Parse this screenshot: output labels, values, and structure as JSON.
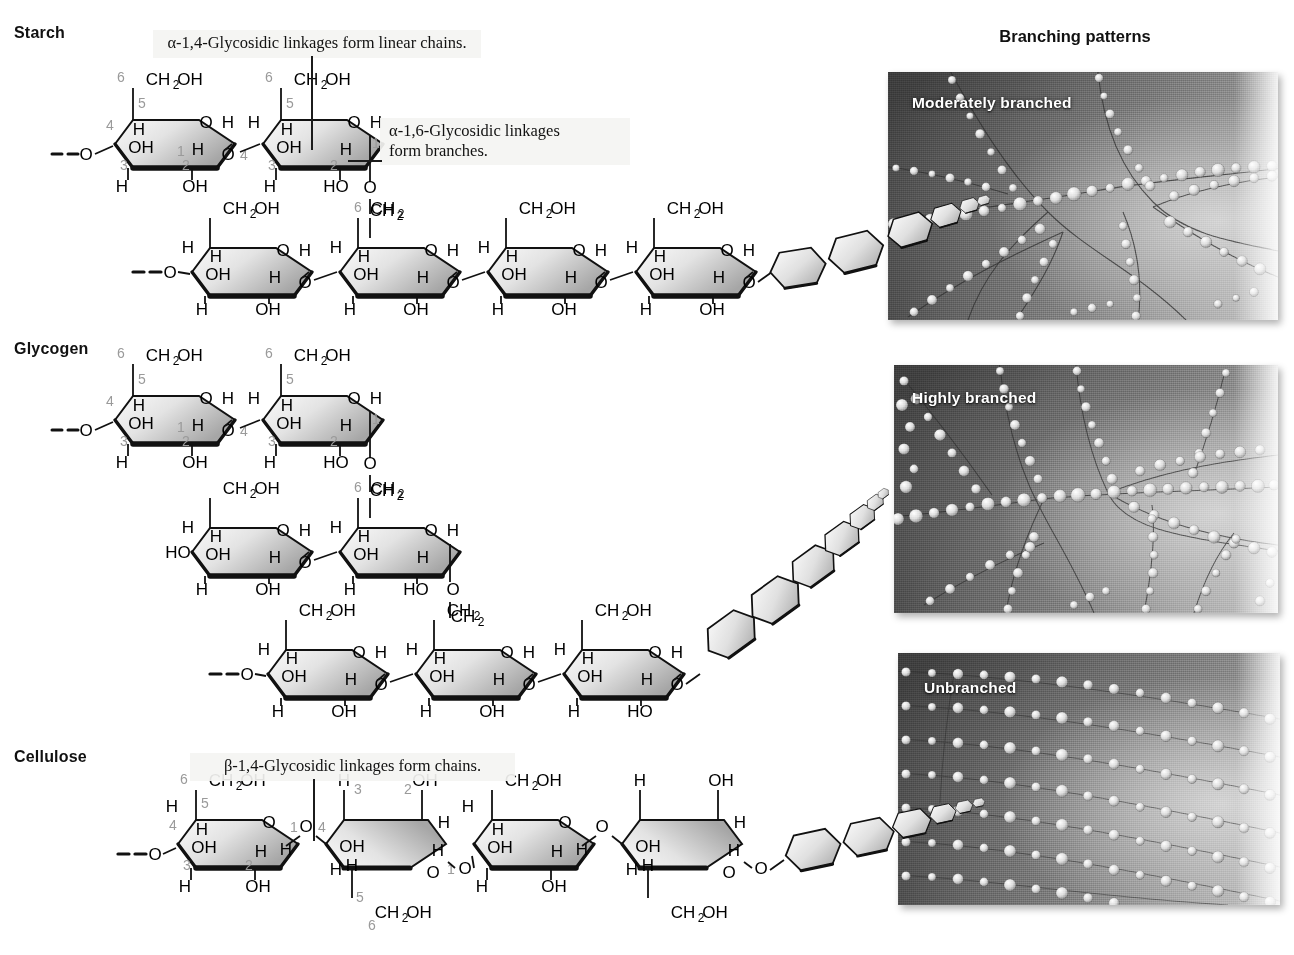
{
  "figure": {
    "type": "polysaccharide-structure-diagram",
    "right_column_header": "Branching patterns"
  },
  "sections": [
    {
      "id": "starch",
      "title": "Starch",
      "callouts": [
        {
          "id": "alpha14",
          "text": "α-1,4-Glycosidic linkages form linear chains."
        },
        {
          "id": "alpha16",
          "line1": "α-1,6-Glycosidic linkages",
          "line2": "form branches."
        }
      ],
      "micrograph": {
        "label": "Moderately branched",
        "pattern": "moderately-branched"
      },
      "ring_numbers": [
        "1",
        "2",
        "3",
        "4",
        "5",
        "6"
      ],
      "groups": [
        "CH₂OH",
        "OH",
        "HO",
        "H",
        "O",
        "CH₂"
      ]
    },
    {
      "id": "glycogen",
      "title": "Glycogen",
      "callouts": [],
      "micrograph": {
        "label": "Highly branched",
        "pattern": "highly-branched"
      },
      "ring_numbers": [
        "1",
        "2",
        "3",
        "4",
        "5",
        "6"
      ],
      "groups": [
        "CH₂OH",
        "OH",
        "HO",
        "H",
        "O",
        "CH₂"
      ]
    },
    {
      "id": "cellulose",
      "title": "Cellulose",
      "callouts": [
        {
          "id": "beta14",
          "text": "β-1,4-Glycosidic linkages form chains."
        }
      ],
      "micrograph": {
        "label": "Unbranched",
        "pattern": "unbranched"
      },
      "ring_numbers": [
        "1",
        "2",
        "3",
        "4",
        "5",
        "6"
      ],
      "groups": [
        "CH₂OH",
        "OH",
        "H",
        "O"
      ]
    }
  ],
  "colors": {
    "ink": "#111111",
    "ring_number": "#9a9a9a",
    "ring_fill_light": "#f2f2f2",
    "ring_fill_dark": "#9d9d9d",
    "callout_bg": "#f4f4f2",
    "micrograph_dark": "#3d3d3d",
    "micrograph_light": "#d0d0d0"
  },
  "labels": {
    "ch2oh": "CH₂OH",
    "ch2": "CH₂",
    "oh": "OH",
    "ho": "HO",
    "h": "H",
    "o": "O"
  }
}
